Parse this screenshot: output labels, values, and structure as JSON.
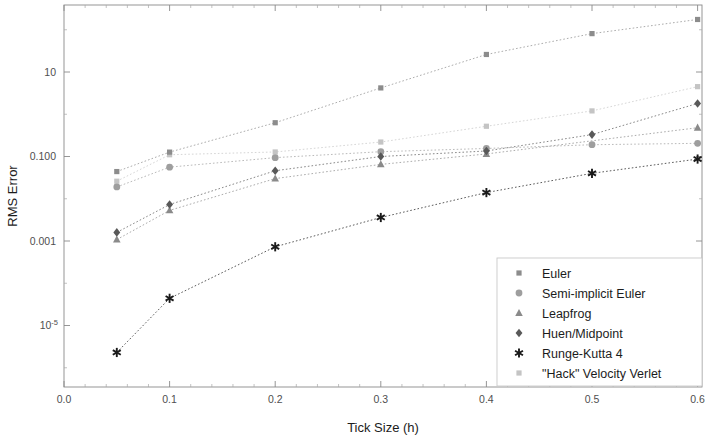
{
  "chart_data": {
    "type": "scatter",
    "title": "",
    "xlabel": "Tick Size (h)",
    "ylabel": "RMS Error",
    "xlim": [
      0.0,
      0.63
    ],
    "ylim": [
      1e-06,
      600
    ],
    "yscale": "log",
    "xscale": "linear",
    "grid": false,
    "legend_position": "bottom-right",
    "x_ticks": [
      "0.0",
      "0.1",
      "0.2",
      "0.3",
      "0.4",
      "0.5",
      "0.6"
    ],
    "x_tick_values": [
      0.0,
      0.1,
      0.2,
      0.3,
      0.4,
      0.5,
      0.6
    ],
    "y_ticks": [
      "10",
      "0.100",
      "0.001",
      "10-5"
    ],
    "y_tick_values": [
      10,
      0.1,
      0.001,
      1e-05
    ],
    "x": [
      0.05,
      0.1,
      0.2,
      0.3,
      0.4,
      0.5,
      0.6
    ],
    "series": [
      {
        "name": "Euler",
        "marker": "square",
        "color": "#8c8c8c",
        "x": [
          0.05,
          0.1,
          0.2,
          0.3,
          0.4,
          0.5,
          0.6
        ],
        "values": [
          0.044,
          0.127,
          0.63,
          4.2,
          26.0,
          81.0,
          175.0
        ]
      },
      {
        "name": "Semi-implicit Euler",
        "marker": "circle",
        "color": "#9e9e9e",
        "x": [
          0.05,
          0.1,
          0.2,
          0.3,
          0.4,
          0.5,
          0.6
        ],
        "values": [
          0.019,
          0.056,
          0.094,
          0.13,
          0.155,
          0.19,
          0.205
        ]
      },
      {
        "name": "Leapfrog",
        "marker": "triangle",
        "color": "#8a8a8a",
        "x": [
          0.05,
          0.1,
          0.2,
          0.3,
          0.4,
          0.6
        ],
        "values": [
          0.00108,
          0.0053,
          0.03,
          0.065,
          0.115,
          0.48
        ]
      },
      {
        "name": "Huen/Midpoint",
        "marker": "diamond",
        "color": "#595959",
        "x": [
          0.05,
          0.1,
          0.2,
          0.3,
          0.4,
          0.5,
          0.6
        ],
        "values": [
          0.0016,
          0.0073,
          0.046,
          0.1,
          0.135,
          0.33,
          1.8
        ]
      },
      {
        "name": "Runge-Kutta 4",
        "marker": "asterisk",
        "color": "#1a1a1a",
        "x": [
          0.05,
          0.1,
          0.2,
          0.3,
          0.4,
          0.5,
          0.6
        ],
        "values": [
          2.3e-06,
          4.4e-05,
          0.00073,
          0.0036,
          0.014,
          0.04,
          0.087
        ]
      },
      {
        "name": "\"Hack\" Velocity Verlet",
        "marker": "square",
        "color": "#c4c4c4",
        "x": [
          0.05,
          0.1,
          0.2,
          0.3,
          0.4,
          0.5,
          0.6
        ],
        "values": [
          0.026,
          0.11,
          0.128,
          0.22,
          0.52,
          1.2,
          4.5
        ]
      }
    ]
  },
  "axes": {
    "y_title": "RMS Error",
    "x_title": "Tick Size (h)",
    "y_labels": [
      {
        "text": "10",
        "sup": "",
        "value": 10
      },
      {
        "text": "0.100",
        "sup": "",
        "value": 0.1
      },
      {
        "text": "0.001",
        "sup": "",
        "value": 0.001
      },
      {
        "text": "10",
        "sup": "-5",
        "value": 1e-05
      }
    ],
    "x_labels": [
      "0.0",
      "0.1",
      "0.2",
      "0.3",
      "0.4",
      "0.5",
      "0.6"
    ]
  },
  "legend": {
    "items": [
      {
        "label": "Euler",
        "marker": "square",
        "color": "#8c8c8c"
      },
      {
        "label": "Semi-implicit Euler",
        "marker": "circle",
        "color": "#9e9e9e"
      },
      {
        "label": "Leapfrog",
        "marker": "triangle",
        "color": "#8a8a8a"
      },
      {
        "label": "Huen/Midpoint",
        "marker": "diamond",
        "color": "#595959"
      },
      {
        "label": "Runge-Kutta 4",
        "marker": "asterisk",
        "color": "#1a1a1a"
      },
      {
        "label": "\"Hack\" Velocity Verlet",
        "marker": "square",
        "color": "#c4c4c4"
      }
    ]
  },
  "colors": {
    "background": "#ffffff",
    "axis": "#8a8a8a",
    "text": "#1c1c1c",
    "ticktext": "#4f4f4f",
    "legend_border": "#c9c9c9"
  }
}
